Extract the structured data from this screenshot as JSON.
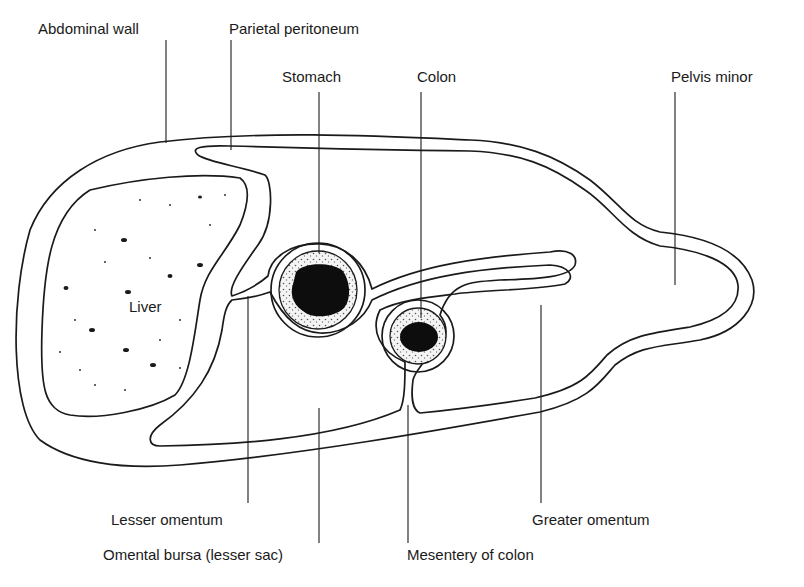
{
  "figure": {
    "type": "anatomical cross-section diagram",
    "labels": {
      "abdominal_wall": "Abdominal wall",
      "parietal_peritoneum": "Parietal peritoneum",
      "stomach": "Stomach",
      "colon": "Colon",
      "pelvis_minor": "Pelvis minor",
      "liver": "Liver",
      "lesser_omentum": "Lesser omentum",
      "omental_bursa": "Omental bursa (lesser sac)",
      "mesentery_of_colon": "Mesentery of colon",
      "greater_omentum": "Greater omentum"
    },
    "colors": {
      "line": "#1a1a1a",
      "bursa_fill": "#c8c8c8",
      "lumen_fill": "#0d0d0d",
      "background": "#ffffff"
    }
  }
}
